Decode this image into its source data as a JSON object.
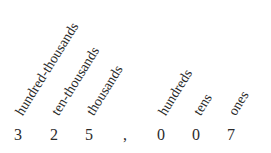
{
  "number": "325,007",
  "digits": [
    {
      "value": "3",
      "place": "hundred-thousands"
    },
    {
      "value": "2",
      "place": "ten-thousands"
    },
    {
      "value": "5",
      "place": "thousands"
    },
    {
      "value": ",",
      "place": ""
    },
    {
      "value": "0",
      "place": "hundreds"
    },
    {
      "value": "0",
      "place": "tens"
    },
    {
      "value": "7",
      "place": "ones"
    }
  ],
  "colors": {
    "text": "#2b2b2b",
    "background": "#ffffff"
  }
}
